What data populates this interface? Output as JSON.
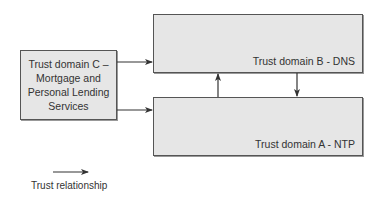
{
  "diagram": {
    "nodes": {
      "b": {
        "id": "trust-domain-b",
        "label": "Trust domain B - DNS"
      },
      "a": {
        "id": "trust-domain-a",
        "label": "Trust domain A - NTP"
      },
      "c": {
        "id": "trust-domain-c",
        "lines": [
          "Trust domain C –",
          "Mortgage and",
          "Personal Lending",
          "Services"
        ]
      }
    },
    "edges": [
      {
        "from": "trust-domain-c",
        "to": "trust-domain-b",
        "type": "trust-relationship"
      },
      {
        "from": "trust-domain-c",
        "to": "trust-domain-a",
        "type": "trust-relationship"
      },
      {
        "from": "trust-domain-a",
        "to": "trust-domain-b",
        "type": "trust-relationship"
      },
      {
        "from": "trust-domain-b",
        "to": "trust-domain-a",
        "type": "trust-relationship"
      }
    ],
    "legend": {
      "arrow_label": "Trust relationship"
    },
    "colors": {
      "box_fill": "#e6e6e6",
      "box_border": "#555555",
      "line": "#333333"
    }
  }
}
